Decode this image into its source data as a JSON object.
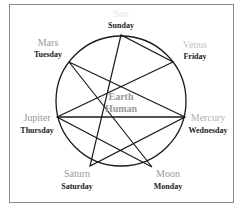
{
  "diagram": {
    "center": {
      "line1": "Earth",
      "line2": "Human"
    },
    "nodes": [
      {
        "planet": "Sun",
        "day": "Sunday"
      },
      {
        "planet": "Venus",
        "day": "Friday"
      },
      {
        "planet": "Mercury",
        "day": "Wednesday"
      },
      {
        "planet": "Moon",
        "day": "Monday"
      },
      {
        "planet": "Saturn",
        "day": "Saturday"
      },
      {
        "planet": "Jupiter",
        "day": "Thursday"
      },
      {
        "planet": "Mars",
        "day": "Tuesday"
      }
    ],
    "colors": {
      "planet_text": "#9a9a9a",
      "day_text": "#222222",
      "lines": "#1a1a1a",
      "frame": "#8a8a8a"
    }
  }
}
